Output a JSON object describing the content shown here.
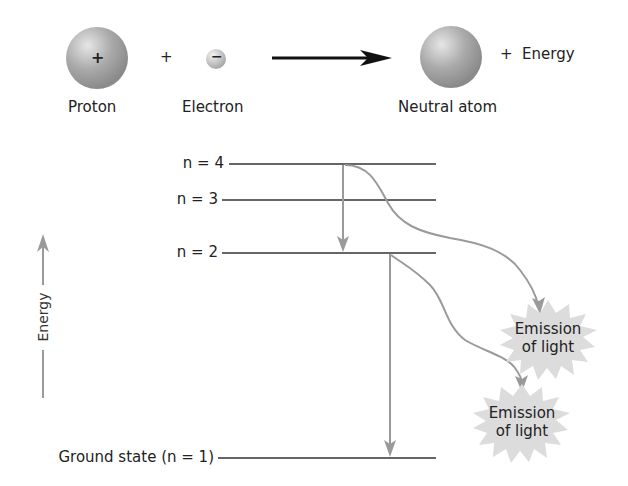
{
  "reaction": {
    "proton_label": "Proton",
    "proton_symbol": "+",
    "plus1": "+",
    "electron_label": "Electron",
    "electron_symbol": "−",
    "product_label": "Neutral atom",
    "energy_term": "+  Energy"
  },
  "energy_levels": [
    {
      "label": "n = 4",
      "y": 164
    },
    {
      "label": "n = 3",
      "y": 200
    },
    {
      "label": "n = 2",
      "y": 253
    },
    {
      "label": "Ground state (n = 1)",
      "y": 458
    }
  ],
  "axis": {
    "label": "Energy"
  },
  "emissions": [
    {
      "line1": "Emission",
      "line2": "of light"
    },
    {
      "line1": "Emission",
      "line2": "of light"
    }
  ],
  "colors": {
    "line": "#333333",
    "transition": "#9a9a9a",
    "burst": "#d8d8d8",
    "sphere": "#a8a8a8"
  }
}
